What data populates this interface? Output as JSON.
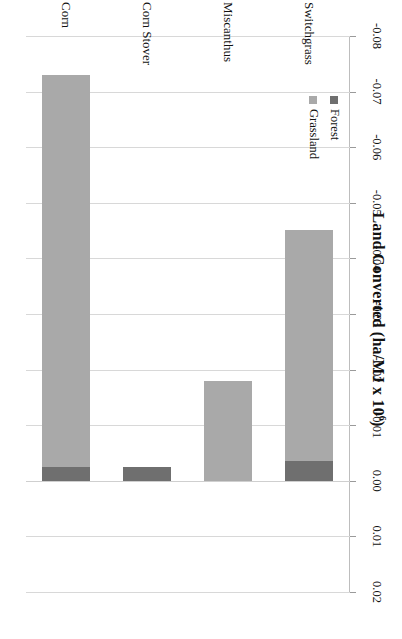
{
  "chart_data": {
    "type": "bar",
    "orientation": "horizontal",
    "title_base": "Land Converted (ha/MJ x 10",
    "title_exponent": "6",
    "title_close": ")",
    "xlabel": "",
    "ylabel": "",
    "xlim": [
      -0.08,
      0.02
    ],
    "xticks": [
      -0.08,
      -0.07,
      -0.06,
      -0.05,
      -0.04,
      -0.03,
      -0.02,
      -0.01,
      0.0,
      0.01,
      0.02
    ],
    "xticklabels": [
      "-0.08",
      "-0.07",
      "-0.06",
      "-0.05",
      "-0.04",
      "-0.03",
      "-0.02",
      "-0.01",
      "0.00",
      "0.01",
      "0.02"
    ],
    "grid": true,
    "grid_axis": "x",
    "stacked": true,
    "categories": [
      "Switchgrass",
      "Miscanthus",
      "Corn Stover",
      "Corn"
    ],
    "legend": [
      "Forest",
      "Grassland"
    ],
    "legend_position": "upper-left-inside",
    "series": [
      {
        "name": "Grassland",
        "color": "#a9a9a9",
        "values": [
          -0.0415,
          -0.018,
          0.0,
          -0.0705
        ]
      },
      {
        "name": "Forest",
        "color": "#6f6f6f",
        "values": [
          -0.0036,
          0.0,
          -0.0024,
          -0.0024
        ]
      }
    ],
    "totals": [
      -0.0451,
      -0.018,
      -0.0024,
      -0.0729
    ],
    "colors": {
      "grassland": "#a9a9a9",
      "forest": "#6f6f6f",
      "grid": "#d8d8d8",
      "axis": "#bdbdbd",
      "text": "#111111",
      "background": "#ffffff"
    }
  }
}
